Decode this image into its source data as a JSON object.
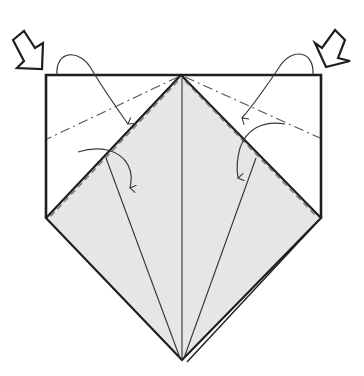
{
  "diagram": {
    "type": "origami-fold-step",
    "colors": {
      "paper_front": "#ffffff",
      "paper_colored": "#e6e6e6",
      "outline": "#1e1e1e",
      "crease": "#444444",
      "arrow": "#3a3a3a"
    },
    "elements": {
      "push_arrows": [
        {
          "side": "left",
          "label": "push-arrow-left"
        },
        {
          "side": "right",
          "label": "push-arrow-right"
        }
      ],
      "fold_arrows": [
        {
          "side": "left",
          "kind": "valley-fold-arrow-upper"
        },
        {
          "side": "left",
          "kind": "valley-fold-arrow-lower"
        },
        {
          "side": "right",
          "kind": "valley-fold-arrow-upper"
        },
        {
          "side": "right",
          "kind": "valley-fold-arrow-lower"
        }
      ],
      "fold_lines": [
        {
          "style": "dash-dot",
          "kind": "mountain-fold",
          "side": "left"
        },
        {
          "style": "dash-dot",
          "kind": "mountain-fold",
          "side": "right"
        },
        {
          "style": "dashed",
          "kind": "valley-fold",
          "side": "left"
        },
        {
          "style": "dashed",
          "kind": "valley-fold",
          "side": "right"
        }
      ]
    }
  }
}
